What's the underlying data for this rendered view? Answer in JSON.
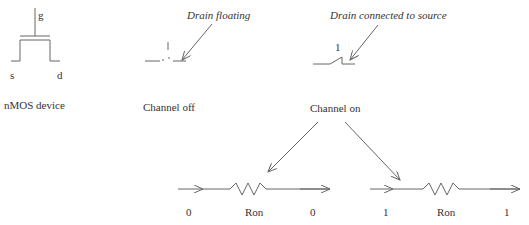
{
  "nmos": {
    "gate_label": "g",
    "source_label": "s",
    "drain_label": "d",
    "caption": "nMOS device"
  },
  "channel_off": {
    "gate_value": "1",
    "annotation": "Drain floating",
    "caption": "Channel off"
  },
  "channel_on": {
    "gate_value": "1",
    "annotation": "Drain connected to source",
    "caption": "Channel on"
  },
  "resistor_left": {
    "input_value": "0",
    "resistor_label": "Ron",
    "output_value": "0"
  },
  "resistor_right": {
    "input_value": "1",
    "resistor_label": "Ron",
    "output_value": "1"
  },
  "colors": {
    "stroke": "#666666",
    "text": "#333333",
    "background": "#ffffff"
  }
}
